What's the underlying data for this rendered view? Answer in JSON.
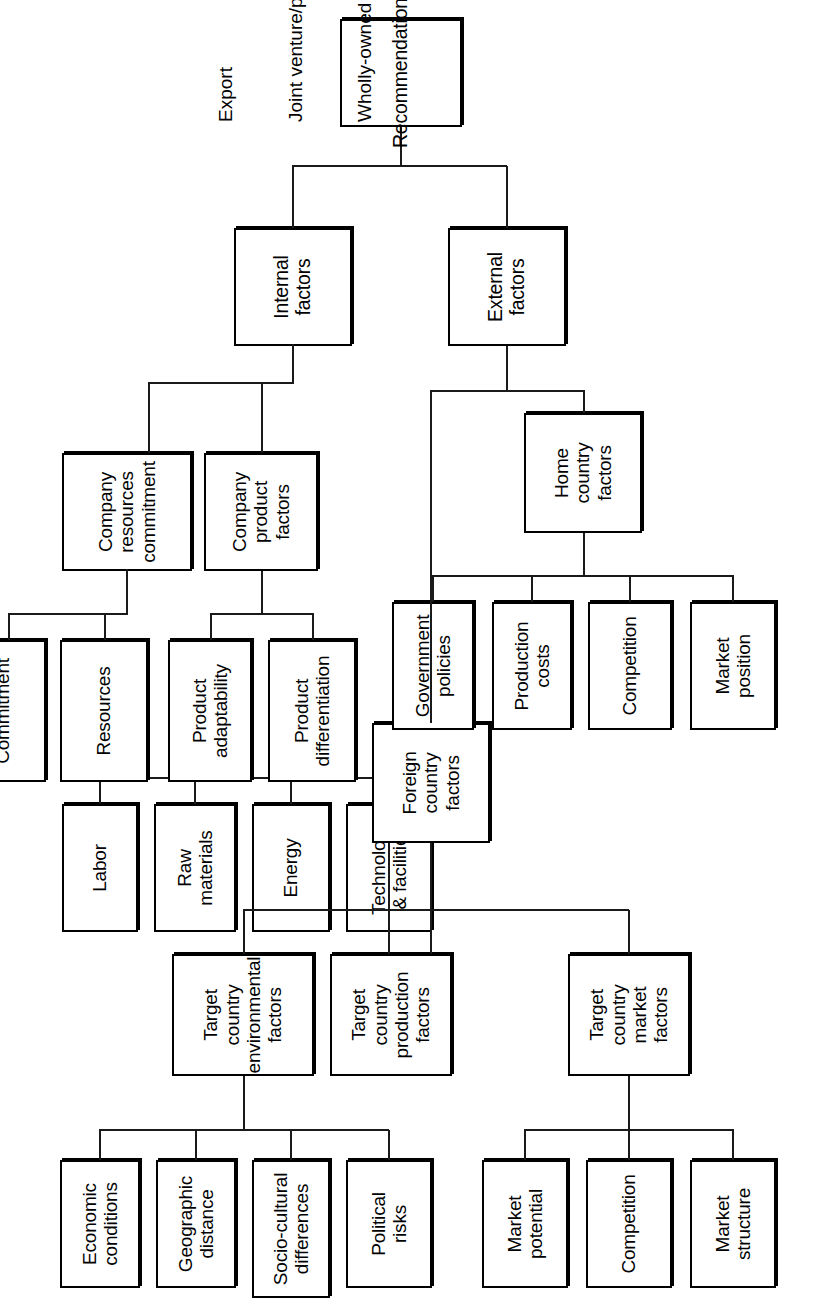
{
  "diagram": {
    "type": "hierarchical-tree",
    "orientation": "rotated-90-counterclockwise",
    "root": "Recommendation",
    "groups": {
      "target_market": {
        "parent": "Target country market factors",
        "children": [
          "Market structure",
          "Competition",
          "Market potential"
        ]
      },
      "target_environmental": {
        "parent": "Target country environmental factors",
        "children": [
          "Political risks",
          "Socio-cultural differences",
          "Geographic distance",
          "Economic conditions"
        ]
      },
      "target_production": {
        "parent": "Target country production factors",
        "children": [
          "Technology & facilities",
          "Energy",
          "Raw materials",
          "Labor"
        ]
      },
      "home_country": {
        "parent": "Home country factors",
        "children": [
          "Market position",
          "Competition",
          "Production costs",
          "Government policies"
        ]
      },
      "company_product": {
        "parent": "Company product factors",
        "children": [
          "Product differentiation",
          "Product adaptability"
        ]
      },
      "company_resources": {
        "parent": "Company resources commitment",
        "children": [
          "Resources",
          "Commitment"
        ]
      }
    }
  },
  "nodes": {
    "market_structure": "Market\nstructure",
    "competition_market": "Competition",
    "market_potential": "Market\npotential",
    "target_country_market_factors": "Target\ncountry\nmarket\nfactors",
    "political_risks": "Political\nrisks",
    "socio_cultural_differences": "Socio-cultural\ndifferences",
    "geographic_distance": "Geographic\ndistance",
    "economic_conditions": "Economic\nconditions",
    "target_country_environmental_factors": "Target country\nenvironmental\nfactors",
    "technology_facilities": "Technology\n& facilities",
    "energy": "Energy",
    "raw_materials": "Raw\nmaterials",
    "labor": "Labor",
    "target_country_production_factors": "Target\ncountry\nproduction\nfactors",
    "market_position": "Market\nposition",
    "competition_home": "Competition",
    "production_costs": "Production\ncosts",
    "government_policies": "Government\npolicies",
    "home_country_factors": "Home\ncountry\nfactors",
    "product_differentiation": "Product\ndifferentiation",
    "product_adaptability": "Product\nadaptability",
    "company_product_factors": "Company\nproduct\nfactors",
    "resources": "Resources",
    "commitment": "Commitment",
    "company_resources_commitment": "Company\nresources\ncommitment",
    "foreign_country_factors": "Foreign\ncountry\nfactors",
    "external_factors": "External factors",
    "internal_factors": "Internal factors",
    "recommendation": "Recommendation"
  },
  "outcomes": {
    "line1": "Export",
    "line2": "Joint venture/partnership contractual agreement",
    "line3": "Wholly-owned subsidiary including mergers and acquisitions"
  },
  "colors": {
    "stroke": "#000000",
    "background": "#ffffff",
    "text": "#000000"
  }
}
